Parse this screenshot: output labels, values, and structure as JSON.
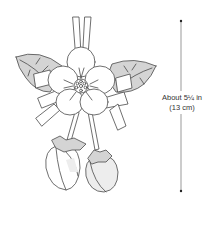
{
  "figure": {
    "measurement": {
      "label_imperial": "About 5¼ in",
      "label_metric": "(13 cm)"
    }
  },
  "colors": {
    "outline": "#4a4a4a",
    "leaf_fill": "#d4d4d4",
    "background": "#ffffff",
    "text": "#333333",
    "dimension_line": "#555555"
  }
}
